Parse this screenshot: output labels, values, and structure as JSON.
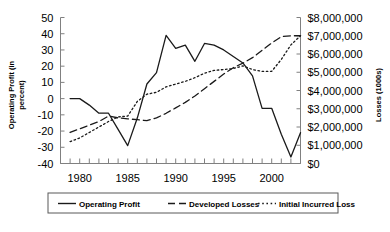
{
  "chart_data": {
    "type": "line",
    "title": "",
    "subtitle": "",
    "xlabel": "",
    "ylabel": "Operating Profit (in percent)",
    "ylabel_line1": "Operating Profit (in",
    "ylabel_line2": "percent)",
    "y2label": "Losses (1000s)",
    "grid": false,
    "legend_position": "bottom",
    "xlim": [
      1978,
      2003
    ],
    "ylim": [
      -40,
      50
    ],
    "y2lim": [
      0,
      8000000
    ],
    "x_tick_labels": [
      "1980",
      "1985",
      "1990",
      "1995",
      "2000"
    ],
    "x_tick_values": [
      1980,
      1985,
      1990,
      1995,
      2000
    ],
    "x_minor_tick_step": 1,
    "y_tick_labels": [
      "50",
      "40",
      "30",
      "20",
      "10",
      "0",
      "-10",
      "-20",
      "-30",
      "-40"
    ],
    "y_tick_values": [
      50,
      40,
      30,
      20,
      10,
      0,
      -10,
      -20,
      -30,
      -40
    ],
    "y2_tick_labels": [
      "$8,000,000",
      "$7,000,000",
      "$6,000,000",
      "$5,000,000",
      "$4,000,000",
      "$3,000,000",
      "$2,000,000",
      "$1,000,000",
      "$0"
    ],
    "y2_tick_values": [
      8000000,
      7000000,
      6000000,
      5000000,
      4000000,
      3000000,
      2000000,
      1000000,
      0
    ],
    "x": [
      1979,
      1980,
      1981,
      1982,
      1983,
      1984,
      1985,
      1986,
      1987,
      1988,
      1989,
      1990,
      1991,
      1992,
      1993,
      1994,
      1995,
      1996,
      1997,
      1998,
      1999,
      2000,
      2001,
      2002,
      2003
    ],
    "series": [
      {
        "name": "Operating Profit",
        "axis": "left",
        "style": "solid",
        "unit": "percent",
        "values": [
          0,
          0,
          -4,
          -9,
          -9,
          -19,
          -29,
          -12,
          9,
          16,
          39,
          31,
          33,
          23,
          34,
          33,
          30,
          26,
          22,
          14,
          -6,
          -6,
          -22,
          -36,
          -21
        ]
      },
      {
        "name": "Developed Losses",
        "axis": "right",
        "style": "dashed",
        "unit": "dollars_1000s",
        "values": [
          1700000,
          1900000,
          2100000,
          2300000,
          2600000,
          2500000,
          2450000,
          2400000,
          2350000,
          2500000,
          2750000,
          3050000,
          3350000,
          3700000,
          4100000,
          4500000,
          4900000,
          5250000,
          5500000,
          5800000,
          6200000,
          6600000,
          6950000,
          7000000,
          7000000
        ]
      },
      {
        "name": "Initial Incurred Loss",
        "axis": "right",
        "style": "dotted",
        "unit": "dollars_1000s",
        "values": [
          1200000,
          1400000,
          1700000,
          2000000,
          2300000,
          2550000,
          2600000,
          3400000,
          3800000,
          3900000,
          4200000,
          4350000,
          4500000,
          4700000,
          4950000,
          5100000,
          5150000,
          5200000,
          5350000,
          5150000,
          5050000,
          5050000,
          5700000,
          6500000,
          7000000
        ]
      }
    ]
  },
  "legend": {
    "items": [
      {
        "label": "Operating Profit",
        "style": "solid"
      },
      {
        "label": "Developed Losses",
        "style": "dashed"
      },
      {
        "label": "Initial Incurred Loss",
        "style": "dotted"
      }
    ]
  }
}
